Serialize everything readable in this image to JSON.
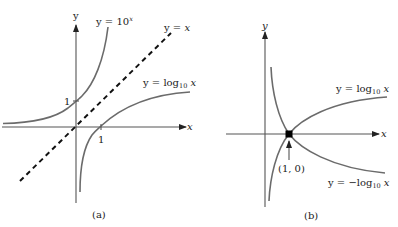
{
  "figure": {
    "panel_a": {
      "caption": "(a)",
      "axis_x_label": "x",
      "axis_y_label": "y",
      "tick_x_1": "1",
      "tick_y_1": "1",
      "curve_exp": {
        "prefix": "y = 10",
        "superscript": "x"
      },
      "curve_identity": {
        "text_y": "y",
        "text_eq": " = ",
        "text_x": "x"
      },
      "curve_log": {
        "prefix": "y = log",
        "subscript": "10",
        "suffix": " x"
      }
    },
    "panel_b": {
      "caption": "(b)",
      "axis_x_label": "x",
      "axis_y_label": "y",
      "point_label": "(1, 0)",
      "curve_log": {
        "prefix": "y = log",
        "subscript": "10",
        "suffix": " x"
      },
      "curve_neg_log": {
        "prefix": "y = −log",
        "subscript": "10",
        "suffix": " x"
      }
    },
    "colors": {
      "curve": "#6b6b6b",
      "axis": "#555555",
      "dashed_line": "#111111",
      "point": "#000000"
    }
  }
}
